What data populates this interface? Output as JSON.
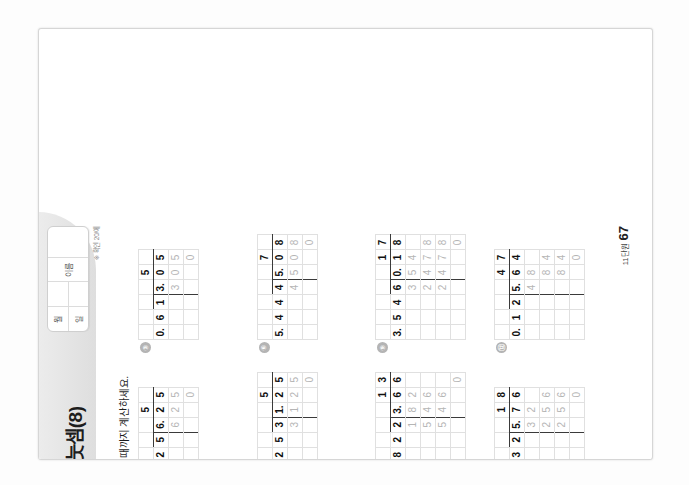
{
  "header": {
    "day_number": "4",
    "day_unit": "일차",
    "type_letter": "B",
    "type_word": "형",
    "title": "소수의 나눗셈(8)",
    "namebox": {
      "month_label": "월",
      "day_label": "일",
      "name_label": "이름",
      "left_top": "월",
      "left_bottom": "일",
      "right_top": "이름"
    },
    "check_note": "※ 확인 20/에"
  },
  "instruction": {
    "icon": "pencil-icon",
    "text": "다음 나눗셈을 완전히 나누어떨어질 때까지 계산하세요."
  },
  "problems": [
    {
      "num": "①",
      "divisor": "0.45",
      "dividend": "3.15",
      "quotient": "7",
      "rows": [
        [
          "",
          "",
          "",
          "",
          "7",
          ""
        ],
        [
          "0.",
          "4",
          "5",
          "3.",
          "1",
          "5"
        ],
        [
          "",
          "",
          "",
          "3",
          "1",
          "5"
        ],
        [
          "",
          "",
          "",
          "",
          "",
          "0"
        ]
      ]
    },
    {
      "num": "②",
      "divisor": "1.25",
      "dividend": "6.25",
      "quotient": "5",
      "rows": [
        [
          "",
          "",
          "",
          "",
          "5",
          ""
        ],
        [
          "1.",
          "2",
          "5",
          "6.",
          "2",
          "5"
        ],
        [
          "",
          "",
          "",
          "6",
          "2",
          "5"
        ],
        [
          "",
          "",
          "",
          "",
          "",
          "0"
        ]
      ]
    },
    {
      "num": "③",
      "divisor": "0.61",
      "dividend": "3.05",
      "quotient": "5",
      "rows": [
        [
          "",
          "",
          "",
          "",
          "5",
          ""
        ],
        [
          "0.",
          "6",
          "1",
          "3.",
          "0",
          "5"
        ],
        [
          "",
          "",
          "",
          "3",
          "0",
          "5"
        ],
        [
          "",
          "",
          "",
          "",
          "",
          "0"
        ]
      ]
    },
    {
      "num": "④",
      "divisor": "1.08",
      "dividend": "8.64",
      "quotient": "8",
      "rows": [
        [
          "",
          "",
          "",
          "",
          "8",
          ""
        ],
        [
          "1.",
          "0",
          "8",
          "8.",
          "6",
          "4"
        ],
        [
          "",
          "",
          "",
          "8",
          "6",
          "4"
        ],
        [
          "",
          "",
          "",
          "",
          "",
          "0"
        ]
      ]
    },
    {
      "num": "⑤",
      "divisor": "6.25",
      "dividend": "31.25",
      "quotient": "5",
      "rows": [
        [
          "",
          "",
          "",
          "",
          "",
          "5",
          ""
        ],
        [
          "6.",
          "2",
          "5",
          "3",
          "1.",
          "2",
          "5"
        ],
        [
          "",
          "",
          "",
          "3",
          "1",
          "2",
          "5"
        ],
        [
          "",
          "",
          "",
          "",
          "",
          "",
          "0"
        ]
      ]
    },
    {
      "num": "⑥",
      "divisor": "5.44",
      "dividend": "45.08",
      "quotient": "7",
      "rows": [
        [
          "",
          "",
          "",
          "",
          "",
          "7",
          ""
        ],
        [
          "5.",
          "4",
          "4",
          "4",
          "5.",
          "0",
          "8"
        ],
        [
          "",
          "",
          "",
          "4",
          "5",
          "0",
          "8"
        ],
        [
          "",
          "",
          "",
          "",
          "",
          "",
          "0"
        ]
      ]
    },
    {
      "num": "⑦",
      "divisor": "2.12",
      "dividend": "36.04",
      "quotient": "17",
      "rows": [
        [
          "",
          "",
          "",
          "",
          "",
          "1",
          "7"
        ],
        [
          "2.",
          "1",
          "2",
          "3",
          "6.",
          "0",
          "4"
        ],
        [
          "",
          "",
          "",
          "2",
          "1",
          "2",
          ""
        ],
        [
          "",
          "",
          "",
          "1",
          "4",
          "8",
          "4"
        ],
        [
          "",
          "",
          "",
          "1",
          "4",
          "8",
          "4"
        ],
        [
          "",
          "",
          "",
          "",
          "",
          "",
          "0"
        ]
      ]
    },
    {
      "num": "⑧",
      "divisor": "1.82",
      "dividend": "23.66",
      "quotient": "13",
      "rows": [
        [
          "",
          "",
          "",
          "",
          "",
          "1",
          "3"
        ],
        [
          "1.",
          "8",
          "2",
          "2",
          "3.",
          "6",
          "6"
        ],
        [
          "",
          "",
          "",
          "1",
          "8",
          "2",
          ""
        ],
        [
          "",
          "",
          "",
          "5",
          "4",
          "6",
          ""
        ],
        [
          "",
          "",
          "",
          "5",
          "4",
          "6",
          ""
        ],
        [
          "",
          "",
          "",
          "",
          "",
          "",
          "0"
        ]
      ]
    },
    {
      "num": "⑨",
      "divisor": "3.54",
      "dividend": "60.18",
      "quotient": "17",
      "rows": [
        [
          "",
          "",
          "",
          "",
          "",
          "1",
          "7"
        ],
        [
          "3.",
          "5",
          "4",
          "6",
          "0.",
          "1",
          "8"
        ],
        [
          "",
          "",
          "",
          "3",
          "5",
          "4",
          ""
        ],
        [
          "",
          "",
          "",
          "2",
          "4",
          "7",
          "8"
        ],
        [
          "",
          "",
          "",
          "2",
          "4",
          "7",
          "8"
        ],
        [
          "",
          "",
          "",
          "",
          "",
          "",
          "0"
        ]
      ]
    },
    {
      "num": "⑩",
      "divisor": "0.48",
      "dividend": "5.28",
      "quotient": "11",
      "rows": [
        [
          "",
          "",
          "",
          "",
          "1",
          "1"
        ],
        [
          "0.",
          "4",
          "8",
          "5.",
          "2",
          "8"
        ],
        [
          "",
          "",
          "",
          "4",
          "8",
          ""
        ],
        [
          "",
          "",
          "",
          "",
          "4",
          "8"
        ],
        [
          "",
          "",
          "",
          "",
          "4",
          "8"
        ],
        [
          "",
          "",
          "",
          "",
          "",
          "0"
        ]
      ]
    },
    {
      "num": "⑪",
      "divisor": "0.32",
      "dividend": "5.76",
      "quotient": "18",
      "rows": [
        [
          "",
          "",
          "",
          "",
          "1",
          "8"
        ],
        [
          "0.",
          "3",
          "2",
          "5.",
          "7",
          "6"
        ],
        [
          "",
          "",
          "",
          "3",
          "2",
          ""
        ],
        [
          "",
          "",
          "",
          "2",
          "5",
          "6"
        ],
        [
          "",
          "",
          "",
          "2",
          "5",
          "6"
        ],
        [
          "",
          "",
          "",
          "",
          "",
          "0"
        ]
      ]
    },
    {
      "num": "⑫",
      "divisor": "0.12",
      "dividend": "5.64",
      "quotient": "47",
      "rows": [
        [
          "",
          "",
          "",
          "",
          "4",
          "7"
        ],
        [
          "0.",
          "1",
          "2",
          "5.",
          "6",
          "4"
        ],
        [
          "",
          "",
          "",
          "4",
          "8",
          ""
        ],
        [
          "",
          "",
          "",
          "",
          "8",
          "4"
        ],
        [
          "",
          "",
          "",
          "",
          "8",
          "4"
        ],
        [
          "",
          "",
          "",
          "",
          "",
          "0"
        ]
      ]
    }
  ],
  "footer": {
    "page_unit": "11단원",
    "page_number": "67",
    "note": "※ 소수의 나눗셈 • 11단원",
    "info_cells": [
      {
        "top": "확인 체크",
        "bottom": "체크"
      },
      {
        "top": "정답수 /12",
        "bottom": "맞은 개수"
      },
      {
        "top": "걸린 시간",
        "bottom": "분    초"
      },
      {
        "top": "정답 확인",
        "bottom": "확인란"
      },
      {
        "top": "평가",
        "bottom": "잘함 보통"
      }
    ]
  },
  "colors": {
    "badge_gray": "#8f8f8f",
    "header_gray": "#e2e2e2",
    "grid_line": "#e0e0e0",
    "rule_dark": "#3a3a3a"
  }
}
